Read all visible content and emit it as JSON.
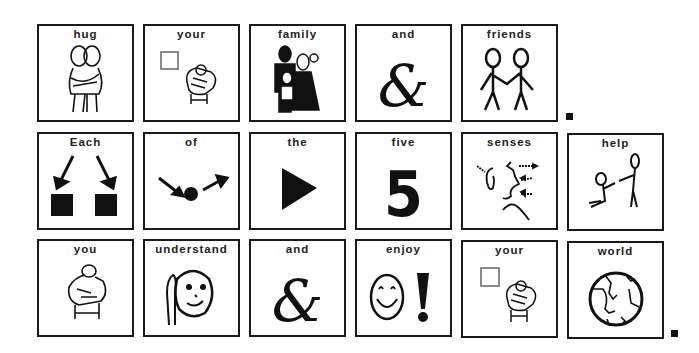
{
  "sentences": [
    {
      "row": 1,
      "cards": [
        {
          "word": "hug",
          "symbol": "hug-icon"
        },
        {
          "word": "your",
          "symbol": "your-icon"
        },
        {
          "word": "family",
          "symbol": "family-icon"
        },
        {
          "word": "and",
          "symbol": "ampersand-icon"
        },
        {
          "word": "friends",
          "symbol": "friends-icon"
        }
      ],
      "end_punctuation": "."
    },
    {
      "row": 2,
      "cards": [
        {
          "word": "Each",
          "symbol": "each-icon"
        },
        {
          "word": "of",
          "symbol": "of-icon"
        },
        {
          "word": "the",
          "symbol": "the-icon"
        },
        {
          "word": "five",
          "symbol": "five-icon",
          "glyph": "5"
        },
        {
          "word": "senses",
          "symbol": "senses-icon"
        },
        {
          "word": "help",
          "symbol": "help-icon"
        }
      ]
    },
    {
      "row": 3,
      "cards": [
        {
          "word": "you",
          "symbol": "you-icon"
        },
        {
          "word": "understand",
          "symbol": "understand-icon"
        },
        {
          "word": "and",
          "symbol": "ampersand-icon"
        },
        {
          "word": "enjoy",
          "symbol": "enjoy-icon",
          "glyph": "!"
        },
        {
          "word": "your",
          "symbol": "your-icon"
        },
        {
          "word": "world",
          "symbol": "world-icon"
        }
      ],
      "end_punctuation": "."
    }
  ],
  "colors": {
    "ink": "#1a1a1a",
    "background": "#ffffff"
  }
}
